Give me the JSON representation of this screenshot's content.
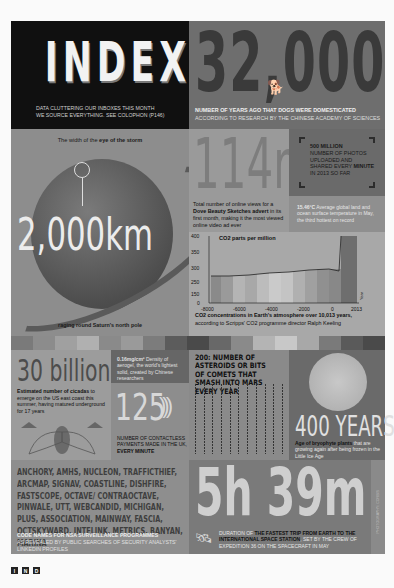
{
  "index": {
    "title": "INDEX",
    "subtitle_line1": "DATA CLUTTERING OUR INBOXES THIS MONTH",
    "subtitle_line2": "WE SOURCE EVERYTHING. SEE COLOPHON (P146)"
  },
  "dogs": {
    "number": "32,000",
    "icon": "dog-icon",
    "title": "NUMBER OF YEARS AGO THAT DOGS WERE DOMESTICATED",
    "source": "ACCORDING TO RESEARCH BY THE CHINESE ACADEMY OF SCIENCES"
  },
  "saturn": {
    "top_prefix": "The width of the ",
    "top_bold": "eye of the storm",
    "number": "2,000km",
    "bottom": "raging round Saturn's north pole"
  },
  "views": {
    "number": "114m",
    "text_prefix": "Total number of online views for a ",
    "text_bold": "Dove Beauty Sketches advert",
    "text_suffix": " in its first month, making it the most viewed online video ad ever"
  },
  "photos": {
    "bold": "500 MILLION",
    "line1": "NUMBER OF PHOTOS UPLOADED AND SHARED EVERY ",
    "bold2": "MINUTE",
    "line2": " IN 2013 SO FAR"
  },
  "temperature": {
    "value": "15.46°C",
    "text": " Average global land and ocean surface temperature in May, the third hottest on record"
  },
  "chart_data": {
    "type": "area",
    "title": "CO2 parts per million",
    "xlabel": "Year",
    "ylabel": "CO2 parts per million",
    "x_ticks": [
      "-8000",
      "-6000",
      "-4000",
      "-2000",
      "0",
      "2013"
    ],
    "y_ticks": [
      0,
      150,
      250,
      300,
      350,
      400
    ],
    "ylim": [
      0,
      400
    ],
    "grid": false,
    "series": [
      {
        "name": "CO2",
        "x": [
          -8000,
          -7000,
          -6000,
          -5000,
          -4000,
          -3000,
          -2000,
          -1000,
          0,
          1000,
          1800,
          1900,
          1950,
          2013
        ],
        "values": [
          260,
          262,
          261,
          263,
          265,
          267,
          270,
          274,
          277,
          279,
          280,
          296,
          311,
          400
        ]
      }
    ],
    "caption_bold": "CO2 concentrations in Earth's atmosphere over 10,013 years,",
    "caption": "according to Scripps' CO2 programme director Ralph Keeling"
  },
  "stripe_colors": [
    "#7a7a7a",
    "#8c8c8c",
    "#a0a0a0",
    "#b0b0b0",
    "#8a8a8a",
    "#9a9a9a",
    "#7c7c7c",
    "#5c5c5c",
    "#4a4a4a",
    "#686868",
    "#8a8a8a",
    "#b4b4b4",
    "#c8c8c8",
    "#a8a8a8",
    "#7a7a7a",
    "#5a5a5a",
    "#4a4a4a"
  ],
  "cicadas": {
    "number": "30 billion",
    "text_bold": "Estimated number of cicadas",
    "text": " to emerge on the US east coast this summer, having matured underground for 17 years",
    "icon": "cicada-icon"
  },
  "aerogel": {
    "value": "0.16mg/cm³",
    "text": " Density of aerogel, the world's lightest solid, created by Chinese researchers"
  },
  "contactless": {
    "number": "125",
    "waves": ")))",
    "line1": "NUMBER OF CONTACTLESS PAYMENTS MADE IN THE UK, ",
    "bold": "EVERY MINUTE"
  },
  "asteroids": {
    "title": "200: NUMBER OF ASTEROIDS OR BITS OF COMETS THAT SMASH INTO MARS EVERY YEAR"
  },
  "moss": {
    "number": "400 YEARS",
    "bold": "Age of bryophyte plants",
    "text": " that are growing again after being frozen in the Little Ice Age"
  },
  "nsa": {
    "codenames": "ANCHORY, AMHS, NUCLEON, TRAFFICTHIEF, ARCMAP, SIGNAV, COASTLINE, DISHFIRE, FASTSCOPE, OCTAVE/ CONTRAOCTAVE, PINWALE, UTT, WEBCANDID, MICHIGAN, PLUS, ASSOCIATION, MAINWAY, FASCIA, OCTSKYWARD, INTELINK, METRICS, BANYAN, MARINA",
    "title": "CODE NAMES FOR NSA SURVEILLANCE PROGRAMMES",
    "sub": "AS REVEALED BY PUBLIC SEARCHES OF SECURITY ANALYSTS' LINKEDIN PROFILES"
  },
  "iss": {
    "number": "5h 39m",
    "icon": "spacecraft-icon",
    "prefix": "DURATION OF ",
    "bold": "THE FASTEST TRIP FROM EARTH TO THE INTERNATIONAL SPACE STATION",
    "suffix": ", SET BY THE CREW OF EXPEDITION 36 ON THE SPACECRAFT IN MAY"
  },
  "credit": "PHOTOGRAPHY: CORBIS",
  "page_nav": [
    "I",
    "N",
    "D"
  ]
}
